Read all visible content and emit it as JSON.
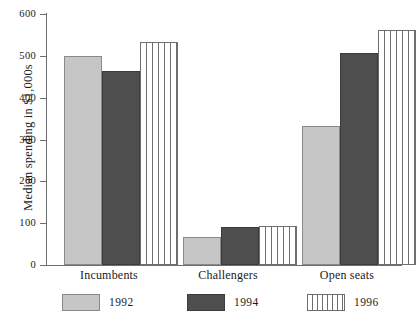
{
  "chart_data": {
    "type": "bar",
    "title": "",
    "subtitle": "",
    "xlabel": "",
    "ylabel": "Median spending in $1,000s",
    "ylim": [
      0,
      600
    ],
    "yticks": [
      0,
      100,
      200,
      300,
      400,
      500,
      600
    ],
    "ytick_labels": [
      "0",
      "100",
      "200",
      "300",
      "400",
      "500",
      "600"
    ],
    "grid": false,
    "legend_position": "bottom",
    "categories": [
      "Incumbents",
      "Challengers",
      "Open seats"
    ],
    "series": [
      {
        "name": "1992",
        "color": "#c6c6c6",
        "pattern": "solid-light-gray",
        "values": [
          499,
          68,
          333
        ]
      },
      {
        "name": "1994",
        "color": "#4e4e4e",
        "pattern": "solid-dark-gray",
        "values": [
          463,
          90,
          508
        ]
      },
      {
        "name": "1996",
        "color": "#ffffff",
        "pattern": "vertical-stripes",
        "values": [
          533,
          94,
          562
        ]
      }
    ],
    "annotations": []
  },
  "axis": {
    "y_title": "Median spending in $1,000s",
    "tick_600": "600",
    "tick_500": "500",
    "tick_400": "400",
    "tick_300": "300",
    "tick_200": "200",
    "tick_100": "100",
    "tick_0": "0"
  },
  "groups": {
    "g0": "Incumbents",
    "g1": "Challengers",
    "g2": "Open seats"
  },
  "legend": {
    "item0": "1992",
    "item1": "1994",
    "item2": "1996"
  }
}
